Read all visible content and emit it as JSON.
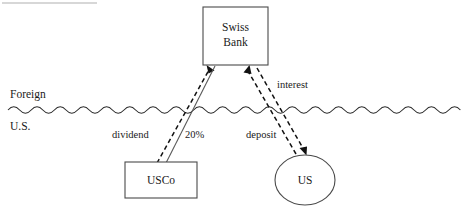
{
  "diagram": {
    "regions": {
      "foreign_label": "Foreign",
      "us_label": "U.S.",
      "border_style": "wavy-line"
    },
    "nodes": [
      {
        "id": "swiss-bank",
        "shape": "rectangle",
        "label_line1": "Swiss",
        "label_line2": "Bank",
        "x": 203,
        "y": 7,
        "width": 65,
        "height": 58
      },
      {
        "id": "usco",
        "shape": "rectangle",
        "label_line1": "USCo",
        "x": 125,
        "y": 162,
        "width": 72,
        "height": 36
      },
      {
        "id": "us",
        "shape": "ellipse",
        "label_line1": "US",
        "cx": 305,
        "cy": 180,
        "rx": 30,
        "ry": 25
      }
    ],
    "edges": [
      {
        "id": "dividend",
        "label": "dividend",
        "from": "usco",
        "to": "swiss-bank",
        "style": "dashed",
        "arrow": "to"
      },
      {
        "id": "ownership",
        "label": "20%",
        "from": "swiss-bank",
        "to": "usco",
        "style": "solid",
        "arrow": "none"
      },
      {
        "id": "interest",
        "label": "interest",
        "from": "us",
        "to": "swiss-bank",
        "style": "dashed",
        "arrow": "to"
      },
      {
        "id": "deposit",
        "label": "deposit",
        "from": "swiss-bank",
        "to": "us",
        "style": "dashed",
        "arrow": "to"
      }
    ],
    "colors": {
      "shape_stroke": "#4a4a4a",
      "flow_stroke": "#111111",
      "solid_stroke": "#5a5a5a",
      "background": "#ffffff",
      "text": "#1a1a1a"
    }
  }
}
